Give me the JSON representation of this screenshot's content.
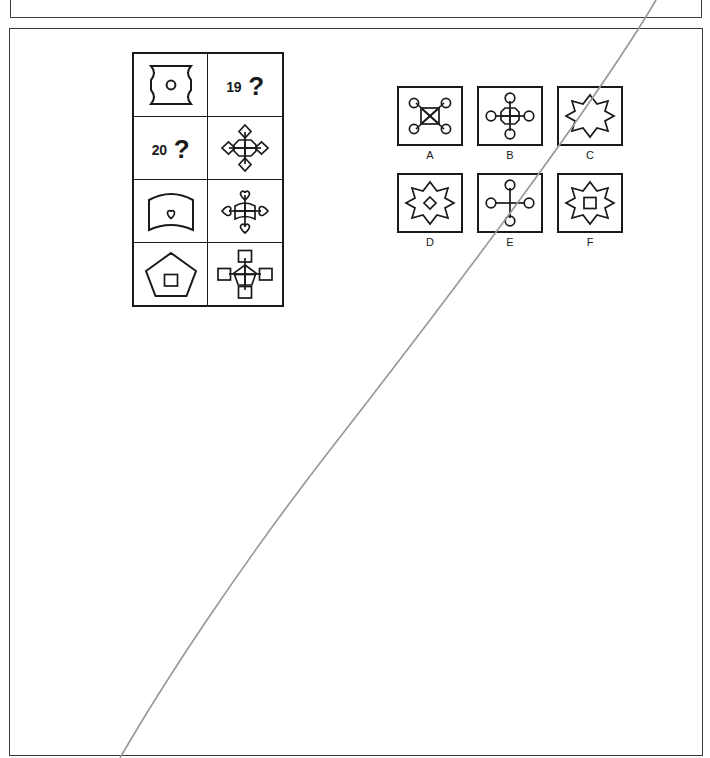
{
  "document": {
    "type": "non-verbal-reasoning-worksheet",
    "background_color": "#ffffff",
    "ink_color": "#1a1a1a",
    "frame_color": "#3b3b3b",
    "artifact_color": "#9a9a9a"
  },
  "matrix": {
    "name": "analogy-matrix",
    "rows": 4,
    "columns": 2,
    "cells": [
      {
        "row": 1,
        "column": 1,
        "kind": "figure",
        "figure": "concave-corner-square-with-circle",
        "description": "Square with inward-curved (concave) corners containing a small circle"
      },
      {
        "row": 1,
        "column": 2,
        "kind": "question",
        "number": "19",
        "question_mark": "?"
      },
      {
        "row": 2,
        "column": 1,
        "kind": "question",
        "number": "20",
        "question_mark": "?"
      },
      {
        "row": 2,
        "column": 2,
        "kind": "figure",
        "figure": "octagon-cross-with-diamonds",
        "description": "Octagon with internal cross, four diamonds on the arms"
      },
      {
        "row": 3,
        "column": 1,
        "kind": "figure",
        "figure": "barrel-shape-with-heart",
        "description": "Curved barrel/shield shape containing a small heart"
      },
      {
        "row": 3,
        "column": 2,
        "kind": "figure",
        "figure": "barrel-cross-with-hearts",
        "description": "Curved barrel with internal cross, four hearts on the arms"
      },
      {
        "row": 4,
        "column": 1,
        "kind": "figure",
        "figure": "pentagon-with-square",
        "description": "Pentagon containing a small square"
      },
      {
        "row": 4,
        "column": 2,
        "kind": "figure",
        "figure": "pentagon-cross-with-squares",
        "description": "Pentagon with internal cross, four squares on the arms"
      }
    ]
  },
  "options": {
    "name": "answer-options",
    "rows": 2,
    "columns": 3,
    "items": [
      {
        "label": "A",
        "figure": "square-with-x-and-four-circles",
        "description": "Square with diagonal X inside and four circles on the diagonals"
      },
      {
        "label": "B",
        "figure": "octagon-cross-with-circles",
        "description": "Octagon with internal cross and four circles on the arms"
      },
      {
        "label": "C",
        "figure": "eight-point-star",
        "description": "Plain eight-pointed star"
      },
      {
        "label": "D",
        "figure": "eight-point-star-with-diamond",
        "description": "Eight-pointed star containing a small diamond"
      },
      {
        "label": "E",
        "figure": "plain-cross-with-circles",
        "description": "Plain cross with four circles on the arm ends, no central shape"
      },
      {
        "label": "F",
        "figure": "eight-point-star-with-square",
        "description": "Eight-pointed star containing a small square"
      }
    ]
  },
  "artifacts": {
    "scan_line": {
      "name": "scan-fold-line",
      "description": "Faint grey diagonal scan/fold curve running from upper right to lower left",
      "color": "#9a9a9a"
    }
  }
}
